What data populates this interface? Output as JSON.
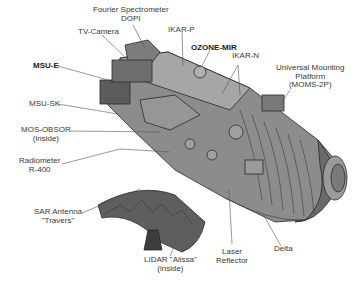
{
  "diagram": {
    "colors": {
      "body": "#8a8a8a",
      "body_dark": "#5a5a5a",
      "body_light": "#b0b0b0",
      "outline": "#2a2a2a",
      "leader_line": "#555555",
      "text": "#3a3a3a"
    },
    "labels": [
      {
        "id": "fourier",
        "line1": "Fourier Spectrometer",
        "line2": "DOPI"
      },
      {
        "id": "tv_camera",
        "line1": "TV-Camera"
      },
      {
        "id": "ikar_p",
        "line1": "IKAR-P"
      },
      {
        "id": "ozone_mir",
        "line1": "OZONE-MIR",
        "bold": true
      },
      {
        "id": "ikar_n",
        "line1": "IKAR-N"
      },
      {
        "id": "moms",
        "line1": "Universal Mounting",
        "line2": "Platform",
        "line3": "(MOMS-2P)"
      },
      {
        "id": "msu_e",
        "line1": "MSU-E",
        "bold": true
      },
      {
        "id": "msu_sk",
        "line1": "MSU-SK"
      },
      {
        "id": "mos_obsor",
        "line1": "MOS-OBSOR",
        "line2": "(inside)"
      },
      {
        "id": "radiometer",
        "line1": "Radiometer",
        "line2": "R-400"
      },
      {
        "id": "sar",
        "line1": "SAR Antenna",
        "line2": "\"Travers\""
      },
      {
        "id": "lidar",
        "line1": "LIDAR \"Alissa\"",
        "line2": "(inside)"
      },
      {
        "id": "laser",
        "line1": "Laser",
        "line2": "Reflector"
      },
      {
        "id": "delta",
        "line1": "Delta"
      }
    ]
  }
}
